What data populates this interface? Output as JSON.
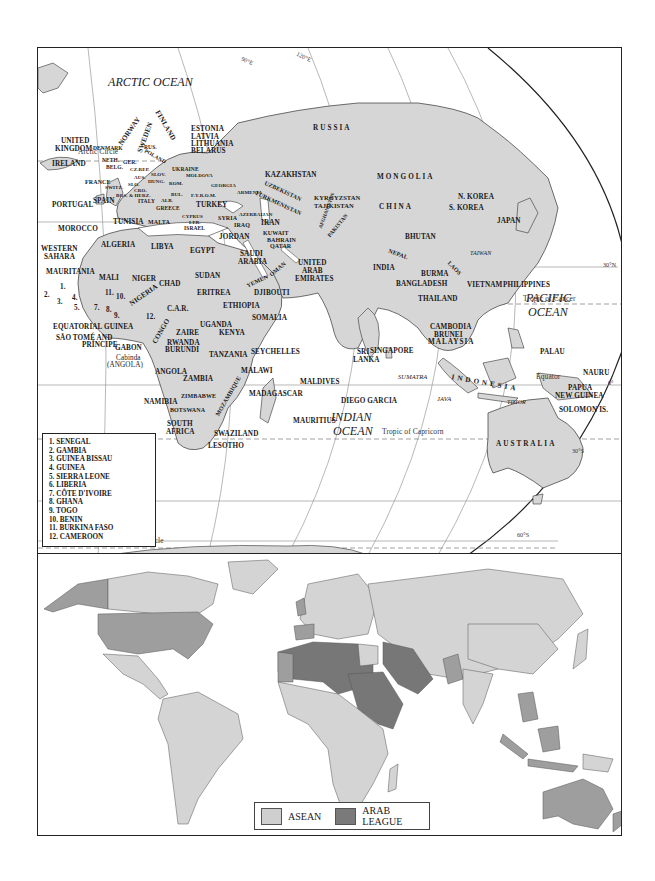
{
  "top_map": {
    "oceans": {
      "arctic": "ARCTIC OCEAN",
      "pacific_1": "PACIFIC",
      "pacific_2": "OCEAN",
      "indian_1": "INDIAN",
      "indian_2": "OCEAN"
    },
    "lines": {
      "arctic_circle": "Arctic Circle",
      "tropic_cancer": "Tropic of Cancer",
      "equator": "Equator",
      "tropic_capricorn": "Tropic of Capricorn",
      "antarctic_circle": "Antarctic Circle"
    },
    "coords": {
      "lon_90e": "90°E",
      "lon_120e": "120°E",
      "lat_30n": "30°N",
      "lat_0": "0°",
      "lat_30s": "30°S",
      "lat_60s": "60°S"
    },
    "countries": {
      "russia": "RUSSIA",
      "estonia": "ESTONIA",
      "latvia": "LATVIA",
      "lithuania": "LITHUANIA",
      "belarus": "BELARUS",
      "norway": "NORWAY",
      "sweden": "SWEDEN",
      "finland": "FINLAND",
      "united_kingdom_1": "UNITED",
      "united_kingdom_2": "KINGDOM",
      "denmark": "DENMARK",
      "ireland": "IRELAND",
      "neth": "NETH.",
      "belg": "BELG.",
      "ger": "GER.",
      "poland": "POLAND",
      "rus": "RUS.",
      "cz_rep": "CZ.REP.",
      "slov": "SLOV.",
      "aus": "AUS.",
      "hung": "HUNG.",
      "ukraine": "UKRAINE",
      "moldova": "MOLDOVA",
      "france": "FRANCE",
      "switz": "SWITZ.",
      "slo": "SLO.",
      "cro": "CRO.",
      "rom": "ROM.",
      "bos_herz": "BOS. & HERZ.",
      "bul": "BUL.",
      "georgia": "GEORGIA",
      "armenia": "ARMENIA",
      "azerbaijan": "AZERBAIJAN",
      "fyrom": "F.Y.R.O.M.",
      "alb": "ALB.",
      "italy": "ITALY",
      "greece": "GREECE",
      "turkey": "TURKEY",
      "portugal": "PORTUGAL",
      "spain": "SPAIN",
      "kazakhstan": "KAZAKHSTAN",
      "uzbekistan": "UZBEKISTAN",
      "turkmenistan": "TURKMENISTAN",
      "kyrgyzstan": "KYRGYZSTAN",
      "tajikistan": "TAJIKISTAN",
      "mongolia": "MONGOLIA",
      "china": "CHINA",
      "n_korea": "N. KOREA",
      "s_korea": "S. KOREA",
      "japan": "JAPAN",
      "taiwan": "TAIWAN",
      "afghanistan": "AFGHANISTAN",
      "pakistan": "PAKISTAN",
      "iran": "IRAN",
      "iraq": "IRAQ",
      "syria": "SYRIA",
      "cyprus": "CYPRUS",
      "leb": "LEB.",
      "israel": "ISRAEL",
      "jordan": "JORDAN",
      "kuwait": "KUWAIT",
      "bahrain": "BAHRAIN",
      "qatar": "QATAR",
      "saudi_1": "SAUDI",
      "saudi_2": "ARABIA",
      "uae_1": "UNITED",
      "uae_2": "ARAB",
      "uae_3": "EMIRATES",
      "yemen": "YEMEN",
      "oman": "OMAN",
      "nepal": "NEPAL",
      "bhutan": "BHUTAN",
      "india": "INDIA",
      "bangladesh": "BANGLADESH",
      "burma": "BURMA",
      "laos": "LAOS",
      "thailand": "THAILAND",
      "vietnam": "VIETNAM",
      "cambodia": "CAMBODIA",
      "philippines": "PHILIPPINES",
      "brunei": "BRUNEI",
      "malaysia": "MALAYSIA",
      "singapore": "SINGAPORE",
      "sri_lanka_1": "SRI",
      "sri_lanka_2": "LANKA",
      "maldives": "MALDIVES",
      "diego_garcia": "DIEGO GARCIA",
      "sumatra": "SUMATRA",
      "java": "JAVA",
      "indonesia": "INDONESIA",
      "timor": "TIMOR",
      "palau": "PALAU",
      "nauru": "NAURU",
      "png_1": "PAPUA",
      "png_2": "NEW GUINEA",
      "solomon": "SOLOMON IS.",
      "australia": "AUSTRALIA",
      "tunisia": "TUNISIA",
      "malta": "MALTA",
      "morocco": "MOROCCO",
      "algeria": "ALGERIA",
      "libya": "LIBYA",
      "egypt": "EGYPT",
      "western_sahara_1": "WESTERN",
      "western_sahara_2": "SAHARA",
      "mauritania": "MAURITANIA",
      "mali": "MALI",
      "niger": "NIGER",
      "chad": "CHAD",
      "sudan": "SUDAN",
      "eritrea": "ERITREA",
      "djibouti": "DJIBOUTI",
      "ethiopia": "ETHIOPIA",
      "somalia": "SOMALIA",
      "nigeria": "NIGERIA",
      "car": "C.A.R.",
      "equatorial_guinea": "EQUATORIAL GUINEA",
      "sao_tome_1": "SÃO TOMÉ AND",
      "sao_tome_2": "PRÍNCIPE",
      "gabon": "GABON",
      "congo": "CONGO",
      "cabinda_1": "Cabinda",
      "cabinda_2": "(ANGOLA)",
      "zaire": "ZAIRE",
      "uganda": "UGANDA",
      "kenya": "KENYA",
      "rwanda": "RWANDA",
      "burundi": "BURUNDI",
      "tanzania": "TANZANIA",
      "seychelles": "SEYCHELLES",
      "angola": "ANGOLA",
      "zambia": "ZAMBIA",
      "malawi": "MALAWI",
      "mozambique": "MOZAMBIQUE",
      "zimbabwe": "ZIMBABWE",
      "namibia": "NAMIBIA",
      "botswana": "BOTSWANA",
      "madagascar": "MADAGASCAR",
      "mauritius": "MAURITIUS",
      "south_africa_1": "SOUTH",
      "south_africa_2": "AFRICA",
      "swaziland": "SWAZILAND",
      "lesotho": "LESOTHO"
    },
    "numbers": [
      "1.",
      "2.",
      "3.",
      "4.",
      "5.",
      "7.",
      "8.",
      "9.",
      "10.",
      "11.",
      "12."
    ],
    "key": [
      "1.   SENEGAL",
      "2.   GAMBIA",
      "3.   GUINEA BISSAU",
      "4.   GUINEA",
      "5.   SIERRA LEONE",
      "6.   LIBERIA",
      "7.   CÔTE D'IVOIRE",
      "8.   GHANA",
      "9.   TOGO",
      "10. BENIN",
      "11. BURKINA FASO",
      "12. CAMEROON"
    ]
  },
  "bottom_map": {
    "legend": [
      {
        "label": "ASEAN",
        "color": "#cfcfcf"
      },
      {
        "label": "ARAB LEAGUE",
        "color": "#7a7a7a"
      }
    ],
    "colors": {
      "base_land": "#d4d4d4",
      "medium_land": "#9e9e9e",
      "dark_land": "#777777",
      "border": "#666666"
    }
  },
  "colors": {
    "land": "#d6d6d6",
    "ocean": "#ffffff",
    "frame": "#222222",
    "gridline": "#888888"
  }
}
